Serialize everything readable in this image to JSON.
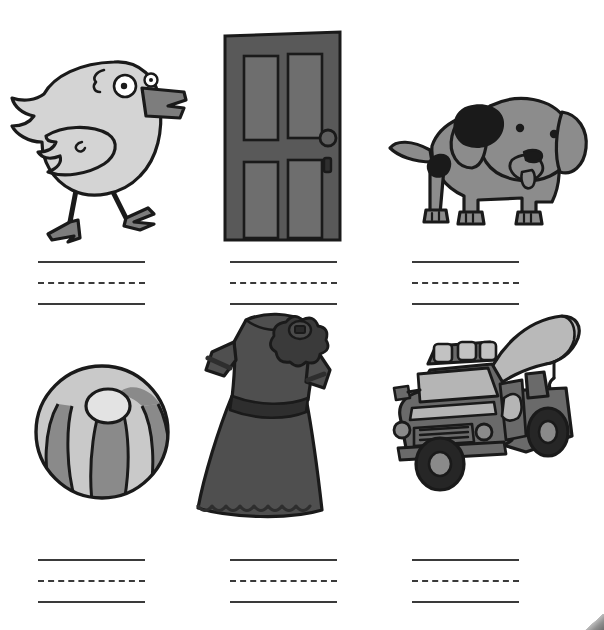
{
  "worksheet": {
    "title": "Letter D Picture Handwriting Practice Worksheet",
    "background_color": "#ffffff",
    "width": 604,
    "height": 630,
    "rows": 2,
    "columns": 3
  },
  "palette": {
    "ink": "#1a1a1a",
    "rule_line": "#3a3a3a",
    "duck_body": "#d4d4d4",
    "duck_beak": "#7d7d7d",
    "duck_eye_white": "#ffffff",
    "duck_pupil": "#1a1a1a",
    "door_frame": "#595959",
    "door_panel": "#6e6e6e",
    "dog_body": "#8c8c8c",
    "dog_spot": "#1a1a1a",
    "ball_dark": "#8a8a8a",
    "ball_light": "#c9c9c9",
    "ball_cap": "#e3e3e3",
    "dress_body": "#4f4f4f",
    "dress_trim": "#2e2e2e",
    "truck_body": "#6a6a6a",
    "truck_light": "#c2c2c2",
    "truck_glass": "#b5b5b5",
    "truck_tire": "#262626",
    "page_curl": "#8f8f8f"
  },
  "cells": [
    {
      "id": "duck",
      "picture_name": "duck",
      "answer_word": "duck",
      "row": 1,
      "column": 1,
      "writing_line_label": "three-line handwriting guide"
    },
    {
      "id": "door",
      "picture_name": "door",
      "answer_word": "door",
      "row": 1,
      "column": 2,
      "writing_line_label": "three-line handwriting guide"
    },
    {
      "id": "dog",
      "picture_name": "dog",
      "answer_word": "dog",
      "row": 1,
      "column": 3,
      "writing_line_label": "three-line handwriting guide"
    },
    {
      "id": "ball",
      "picture_name": "beach ball",
      "answer_word": "ball",
      "row": 2,
      "column": 1,
      "writing_line_label": "three-line handwriting guide"
    },
    {
      "id": "dress",
      "picture_name": "dress",
      "answer_word": "dress",
      "row": 2,
      "column": 2,
      "writing_line_label": "three-line handwriting guide"
    },
    {
      "id": "truck",
      "picture_name": "tow truck",
      "answer_word": "truck",
      "row": 2,
      "column": 3,
      "writing_line_label": "three-line handwriting guide"
    }
  ],
  "rule_group": {
    "line_types": [
      "solid",
      "dashed",
      "solid"
    ],
    "count_per_cell": 3
  }
}
